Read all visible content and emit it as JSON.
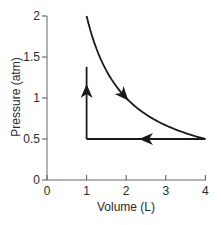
{
  "chart_data": {
    "type": "line",
    "title": "",
    "xlabel": "Volume (L)",
    "ylabel": "Pressure (atm)",
    "xlim": [
      0,
      4
    ],
    "ylim": [
      0,
      2
    ],
    "x_ticks": [
      0,
      1,
      2,
      3,
      4
    ],
    "x_tick_labels": [
      "0",
      "1",
      "2",
      "3",
      "4"
    ],
    "y_ticks": [
      0,
      0.5,
      1,
      1.5,
      2
    ],
    "y_tick_labels": [
      "0",
      "0.5",
      "1",
      "1.5",
      "2"
    ],
    "grid": false,
    "legend": null,
    "series": [
      {
        "name": "isothermal expansion",
        "description": "Curve P = 2/V from (1, 2) to (4, 0.5), arrow pointing toward increasing volume",
        "x": [
          1,
          1.25,
          1.5,
          1.75,
          2,
          2.5,
          3,
          3.5,
          4
        ],
        "y": [
          2,
          1.6,
          1.333,
          1.143,
          1,
          0.8,
          0.667,
          0.571,
          0.5
        ],
        "direction": "down-right"
      },
      {
        "name": "isobaric compression",
        "description": "Horizontal line at P = 0.5 from V = 4 to V = 1, arrow pointing left",
        "x": [
          4,
          1
        ],
        "y": [
          0.5,
          0.5
        ],
        "direction": "left"
      },
      {
        "name": "isochoric pressure increase",
        "description": "Vertical line at V = 1 from P = 0.5 to about P = 1.38, arrow pointing up",
        "x": [
          1,
          1
        ],
        "y": [
          0.5,
          1.38
        ],
        "direction": "up"
      }
    ]
  },
  "colors": {
    "line": "#1a1a1a",
    "axis": "#555555",
    "text": "#2a2a2a"
  }
}
